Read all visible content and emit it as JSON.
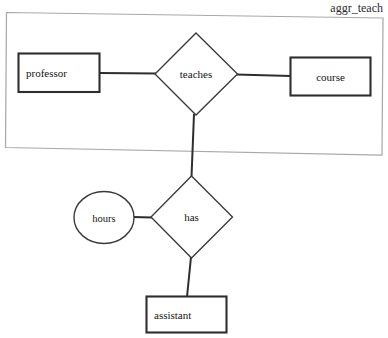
{
  "diagram": {
    "type": "er-diagram",
    "title": "aggr_teach",
    "background_color": "#ffffff",
    "aggregation": {
      "name": "aggr_teach",
      "label": "aggr_teach",
      "border_color": "#a9a9a9"
    },
    "entities": [
      {
        "id": "professor",
        "label": "professor",
        "shape": "rectangle"
      },
      {
        "id": "course",
        "label": "course",
        "shape": "rectangle"
      },
      {
        "id": "assistant",
        "label": "assistant",
        "shape": "rectangle"
      }
    ],
    "relationships": [
      {
        "id": "teaches",
        "label": "teaches",
        "shape": "diamond"
      },
      {
        "id": "has",
        "label": "has",
        "shape": "diamond"
      }
    ],
    "attributes": [
      {
        "id": "hours",
        "label": "hours",
        "shape": "ellipse"
      }
    ],
    "connections": [
      {
        "from": "professor",
        "to": "teaches"
      },
      {
        "from": "teaches",
        "to": "course"
      },
      {
        "from": "teaches",
        "to": "has"
      },
      {
        "from": "hours",
        "to": "has"
      },
      {
        "from": "has",
        "to": "assistant"
      }
    ],
    "colors": {
      "shape_stroke": "#2e2e2e",
      "diamond_stroke": "#3a3a3a",
      "aggregation_stroke": "#a9a9a9",
      "text": "#141414"
    }
  }
}
